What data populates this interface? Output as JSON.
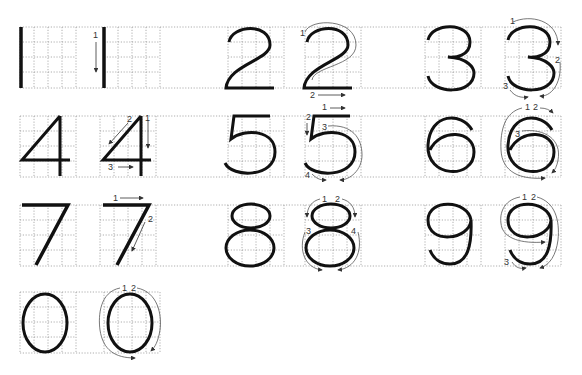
{
  "colors": {
    "stroke": "#111111",
    "guide": "#555555",
    "grid": "#9a9a9a"
  },
  "rows": [
    {
      "y": 27,
      "x_start": 20,
      "x_end": 561,
      "cells": [
        20,
        104,
        228,
        305,
        425,
        505
      ]
    },
    {
      "y": 116,
      "x_start": 20,
      "x_end": 561,
      "cells": [
        20,
        100,
        228,
        305,
        425,
        505
      ]
    },
    {
      "y": 205,
      "x_start": 20,
      "x_end": 561,
      "cells": [
        20,
        100,
        228,
        305,
        425,
        505
      ]
    },
    {
      "y": 292,
      "x_start": 20,
      "x_end": 160,
      "cells": [
        20,
        104
      ]
    }
  ],
  "digits": [
    {
      "digit": "1",
      "strokes": [
        "1"
      ]
    },
    {
      "digit": "2",
      "strokes": [
        "1",
        "2"
      ]
    },
    {
      "digit": "3",
      "strokes": [
        "1",
        "2",
        "3"
      ]
    },
    {
      "digit": "4",
      "strokes": [
        "1",
        "2",
        "3"
      ]
    },
    {
      "digit": "5",
      "strokes": [
        "1",
        "2",
        "3",
        "4"
      ]
    },
    {
      "digit": "6",
      "strokes": [
        "1",
        "2",
        "3"
      ]
    },
    {
      "digit": "7",
      "strokes": [
        "1",
        "2"
      ]
    },
    {
      "digit": "8",
      "strokes": [
        "1",
        "2",
        "3",
        "4"
      ]
    },
    {
      "digit": "9",
      "strokes": [
        "1",
        "2",
        "3"
      ]
    },
    {
      "digit": "0",
      "strokes": [
        "1",
        "2"
      ]
    }
  ],
  "labels": {
    "one_1": "1",
    "two_1": "1",
    "two_2": "2",
    "three_1": "1",
    "three_2": "2",
    "three_3": "3",
    "four_1": "1",
    "four_2": "2",
    "four_3": "3",
    "five_1": "1",
    "five_2": "2",
    "five_3": "3",
    "five_4": "4",
    "six_1": "1",
    "six_2": "2",
    "six_3": "3",
    "seven_1": "1",
    "seven_2": "2",
    "eight_1": "1",
    "eight_2": "2",
    "eight_3": "3",
    "eight_4": "4",
    "nine_1": "1",
    "nine_2": "2",
    "nine_3": "3",
    "zero_1": "1",
    "zero_2": "2"
  }
}
